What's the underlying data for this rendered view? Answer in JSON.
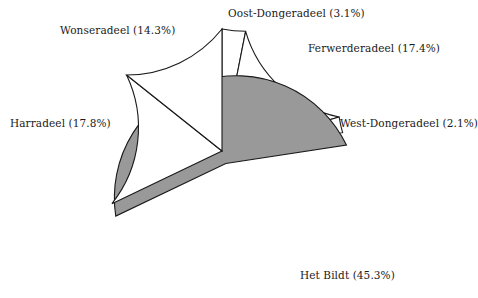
{
  "figure": {
    "kind": "pie-chart",
    "background_color": "#ffffff",
    "line_color": "#1a1a1a"
  },
  "chart_data": {
    "type": "pie",
    "title": "",
    "subtitle": "",
    "xlabel": "",
    "ylabel": "",
    "legend_position": "none",
    "grid": false,
    "start_angle_deg": 90,
    "direction": "clockwise",
    "units": "percent",
    "categories": [
      "Oost-Dongeradeel",
      "Ferwerderadeel",
      "West-Dongeradeel",
      "Het Bildt",
      "Harradeel",
      "Wonseradeel"
    ],
    "values": [
      3.1,
      17.4,
      2.1,
      45.3,
      17.8,
      14.3
    ],
    "total": 100.0,
    "slices": [
      {
        "name": "Oost-Dongeradeel",
        "value": 3.1,
        "label": "Oost-Dongeradeel (3.1%)",
        "color": "#ffffff",
        "exploded": false
      },
      {
        "name": "Ferwerderadeel",
        "value": 17.4,
        "label": "Ferwerderadeel (17.4%)",
        "color": "#ffffff",
        "exploded": false
      },
      {
        "name": "West-Dongeradeel",
        "value": 2.1,
        "label": "West-Dongeradeel (2.1%)",
        "color": "#ffffff",
        "exploded": false
      },
      {
        "name": "Het Bildt",
        "value": 45.3,
        "label": "Het Bildt (45.3%)",
        "color": "#999999",
        "exploded": true
      },
      {
        "name": "Harradeel",
        "value": 17.8,
        "label": "Harradeel (17.8%)",
        "color": "#ffffff",
        "exploded": false
      },
      {
        "name": "Wonseradeel",
        "value": 14.3,
        "label": "Wonseradeel (14.3%)",
        "color": "#ffffff",
        "exploded": false
      }
    ]
  }
}
